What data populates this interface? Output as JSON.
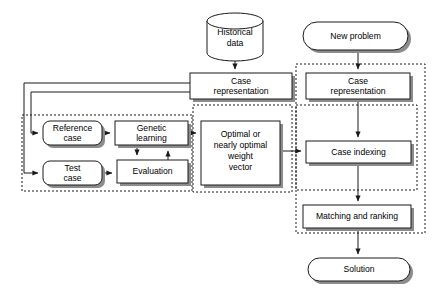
{
  "diagram": {
    "nodes": {
      "historical_data": {
        "label_line1": "Historical",
        "label_line2": "data",
        "shape": "cylinder"
      },
      "new_problem": {
        "label": "New problem",
        "shape": "rounded-terminator"
      },
      "case_representation_left": {
        "label_line1": "Case",
        "label_line2": "representation",
        "shape": "rectangle"
      },
      "case_representation_right": {
        "label_line1": "Case",
        "label_line2": "representation",
        "shape": "rectangle"
      },
      "reference_case": {
        "label_line1": "Reference",
        "label_line2": "case",
        "shape": "rounded-rectangle"
      },
      "test_case": {
        "label_line1": "Test",
        "label_line2": "case",
        "shape": "rounded-rectangle"
      },
      "genetic_learning": {
        "label_line1": "Genetic",
        "label_line2": "learning",
        "shape": "rectangle"
      },
      "evaluation": {
        "label": "Evaluation",
        "shape": "rectangle"
      },
      "weight_vector": {
        "label_line1": "Optimal or",
        "label_line2": "nearly optimal",
        "label_line3": "weight",
        "label_line4": "vector",
        "shape": "rectangle"
      },
      "case_indexing": {
        "label": "Case indexing",
        "shape": "rectangle"
      },
      "matching_and_ranking": {
        "label": "Matching and ranking",
        "shape": "rectangle"
      },
      "solution": {
        "label": "Solution",
        "shape": "rounded-terminator"
      }
    },
    "groups": {
      "learning_group": {
        "label": ""
      },
      "weight_group": {
        "label": ""
      },
      "retrieval_inner_group": {
        "label": ""
      },
      "retrieval_outer_group": {
        "label": ""
      }
    },
    "colors": {
      "stroke": "#1a1a1a",
      "fill": "#ffffff",
      "shadow": "#8c8c8c",
      "background": "#ffffff"
    }
  }
}
